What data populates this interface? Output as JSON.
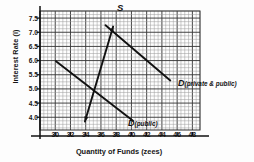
{
  "chart_data": {
    "type": "line",
    "title": "",
    "xlabel": "Quantity of Funds (zees)",
    "ylabel": "Interest Rate (i)",
    "xlim": [
      28,
      49
    ],
    "ylim": [
      3.55,
      7.75
    ],
    "xticks": [
      30,
      32,
      34,
      36,
      38,
      40,
      42,
      44,
      46,
      48
    ],
    "yticks": [
      4.0,
      4.5,
      5.0,
      5.5,
      6.0,
      6.5,
      7.0,
      7.5
    ],
    "grid": true,
    "grid_minor_step_x": 0.5,
    "grid_minor_step_y": 0.125,
    "legend": "inline-annotations",
    "series": [
      {
        "name": "S",
        "label": "S",
        "label_sub": "",
        "color": "#111111",
        "points": [
          [
            33.9,
            3.85
          ],
          [
            37.6,
            7.2
          ]
        ],
        "arrowhead": "both"
      },
      {
        "name": "D (private & public)",
        "label": "D",
        "label_sub": "(private  & public)",
        "color": "#111111",
        "points": [
          [
            36.6,
            7.25
          ],
          [
            45.1,
            5.3
          ]
        ],
        "arrowhead": "none"
      },
      {
        "name": "D (public)",
        "label": "D",
        "label_sub": "(public)",
        "color": "#111111",
        "points": [
          [
            30.1,
            5.98
          ],
          [
            40.2,
            3.88
          ]
        ],
        "arrowhead": "none"
      }
    ],
    "annotations": [
      {
        "name": "equilibrium-public",
        "x": 35.5,
        "y": 4.9
      },
      {
        "name": "equilibrium-private-public",
        "x": 37.3,
        "y": 7.05
      }
    ]
  }
}
